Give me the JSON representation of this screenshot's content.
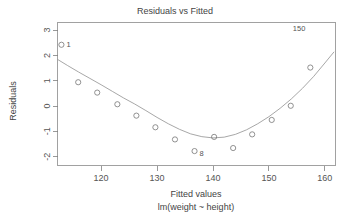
{
  "chart_data": {
    "type": "scatter",
    "title": "Residuals vs Fitted",
    "xlabel": "Fitted values",
    "sublabel": "lm(weight ~ height)",
    "ylabel": "Residuals",
    "xlim": [
      112.2,
      161.9
    ],
    "ylim": [
      -2.35,
      3.3
    ],
    "xticks": [
      120,
      130,
      140,
      150,
      160
    ],
    "xtick_labels": [
      "120",
      "130",
      "140",
      "150",
      "160"
    ],
    "yticks": [
      -2,
      -1,
      0,
      1,
      2,
      3
    ],
    "ytick_labels": [
      "-2",
      "-1",
      "0",
      "1",
      "2",
      "3"
    ],
    "grid": false,
    "legend": null,
    "marker": "open-circle",
    "series": [
      {
        "name": "residuals",
        "x": [
          112.9,
          115.9,
          119.3,
          122.9,
          126.3,
          129.7,
          133.2,
          136.7,
          140.2,
          143.6,
          147.0,
          150.5,
          153.9,
          157.4
        ],
        "y": [
          2.42,
          0.94,
          0.53,
          0.07,
          -0.38,
          -0.84,
          -1.32,
          -1.78,
          -1.22,
          -1.66,
          -1.12,
          -0.55,
          0.01,
          1.52
        ]
      }
    ],
    "smoother": {
      "name": "loess",
      "x": [
        112.3,
        114.0,
        116.0,
        118.0,
        120.0,
        122.0,
        124.0,
        126.0,
        128.0,
        130.0,
        132.0,
        134.0,
        136.0,
        138.0,
        140.0,
        142.0,
        144.0,
        146.0,
        148.0,
        150.0,
        152.0,
        154.0,
        156.0,
        158.0,
        160.0,
        161.6
      ],
      "y": [
        1.83,
        1.6,
        1.34,
        1.09,
        0.84,
        0.58,
        0.32,
        0.08,
        -0.18,
        -0.45,
        -0.7,
        -0.92,
        -1.1,
        -1.21,
        -1.26,
        -1.23,
        -1.12,
        -0.94,
        -0.7,
        -0.42,
        -0.09,
        0.28,
        0.7,
        1.17,
        1.7,
        2.13
      ]
    },
    "point_labels": [
      {
        "text": "1",
        "x": 112.9,
        "y": 2.42,
        "anchor": "right"
      },
      {
        "text": "150",
        "x": 157.4,
        "y": 3.05,
        "anchor": "left"
      },
      {
        "text": "8",
        "x": 136.7,
        "y": -1.88,
        "anchor": "right"
      }
    ]
  }
}
